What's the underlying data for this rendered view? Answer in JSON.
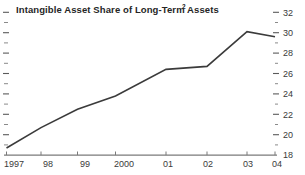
{
  "chart_data": {
    "type": "line",
    "title": "Intangible Asset Share of Long-Term Assets",
    "title_superscript": "2",
    "xlabel": "",
    "ylabel": "",
    "x": [
      1997,
      1998,
      1999,
      2000,
      2001,
      2002,
      2003,
      2004
    ],
    "x_tick_labels": [
      "1997",
      "98",
      "99",
      "2000",
      "01",
      "02",
      "03",
      "04"
    ],
    "values": [
      18.7,
      20.7,
      22.5,
      23.8,
      26.4,
      26.7,
      30.1,
      29.6
    ],
    "series": [
      {
        "name": "Intangible Asset Share of Long-Term Assets",
        "values": [
          18.7,
          20.7,
          22.5,
          23.8,
          26.4,
          26.7,
          30.1,
          29.6
        ]
      }
    ],
    "ylim": [
      18,
      32.5
    ],
    "y_ticks": [
      18,
      20,
      22,
      24,
      26,
      28,
      30,
      32
    ],
    "y_tick_labels": [
      "18",
      "20",
      "22",
      "24",
      "26",
      "28",
      "30",
      "32"
    ],
    "y_minor_ticks": [
      19,
      21,
      23,
      25,
      27,
      29,
      31,
      32.3
    ],
    "y_axis_position": "right",
    "grid": false,
    "legend": false,
    "line_color": "#3b3b3b",
    "axis_color": "#7a7a7a",
    "text_color": "#3a3a3a",
    "background_color": "#ffffff"
  }
}
